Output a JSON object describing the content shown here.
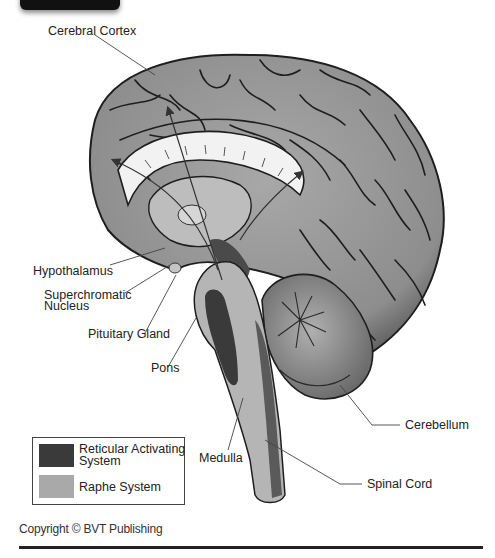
{
  "diagram": {
    "labels": {
      "cerebral_cortex": "Cerebral Cortex",
      "hypothalamus": "Hypothalamus",
      "superchromatic_nucleus": "Superchromatic\nNucleus",
      "pituitary_gland": "Pituitary Gland",
      "pons": "Pons",
      "medulla": "Medulla",
      "cerebellum": "Cerebellum",
      "spinal_cord": "Spinal Cord"
    },
    "legend": [
      {
        "label": "Reticular Activating\nSystem",
        "color": "#3a3a3a"
      },
      {
        "label": "Raphe System",
        "color": "#a9a9a9"
      }
    ],
    "colors": {
      "cortex": "#9a9a9a",
      "sulci": "#222222",
      "corpus_callosum": "#f2f2f2",
      "cerebellum": "#8e8e8e",
      "brainstem": "#b5b5b5"
    }
  },
  "footer": {
    "copyright": "Copyright © BVT Publishing"
  }
}
